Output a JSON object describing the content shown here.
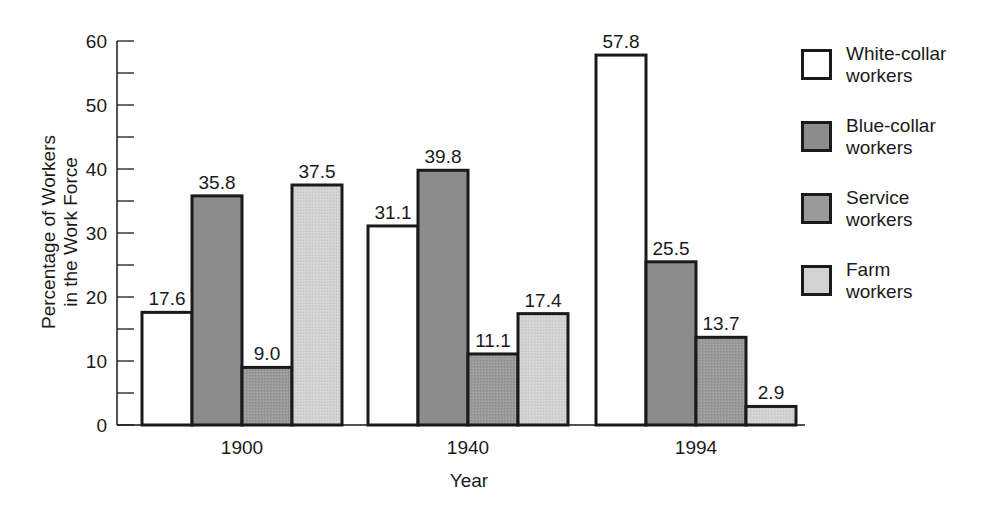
{
  "chart_data": {
    "type": "bar",
    "title": "",
    "xlabel": "Year",
    "ylabel": "Percentage of Workers in the Work Force",
    "ylabel_lines": [
      "Percentage of Workers",
      "in the Work Force"
    ],
    "ylim": [
      0,
      60
    ],
    "yticks": [
      0,
      10,
      20,
      30,
      40,
      50,
      60
    ],
    "minor_ytick_step": 5,
    "categories": [
      "1900",
      "1940",
      "1994"
    ],
    "series": [
      {
        "name": "White-collar workers",
        "legend_lines": [
          "White-collar",
          "workers"
        ],
        "color": "#ffffff",
        "values": [
          17.6,
          31.1,
          57.8
        ],
        "labels": [
          "17.6",
          "31.1",
          "57.8"
        ]
      },
      {
        "name": "Blue-collar workers",
        "legend_lines": [
          "Blue-collar",
          "workers"
        ],
        "color": "#8c8c8c",
        "values": [
          35.8,
          39.8,
          25.5
        ],
        "labels": [
          "35.8",
          "39.8",
          "25.5"
        ]
      },
      {
        "name": "Service workers",
        "legend_lines": [
          "Service",
          "workers"
        ],
        "color": "#9a9a9a",
        "values": [
          9.0,
          11.1,
          13.7
        ],
        "labels": [
          "9.0",
          "11.1",
          "13.7"
        ]
      },
      {
        "name": "Farm workers",
        "legend_lines": [
          "Farm",
          "workers"
        ],
        "color": "#d2d2d2",
        "values": [
          37.5,
          17.4,
          2.9
        ],
        "labels": [
          "37.5",
          "17.4",
          "2.9"
        ]
      }
    ],
    "legend_position": "right",
    "grid": false
  }
}
